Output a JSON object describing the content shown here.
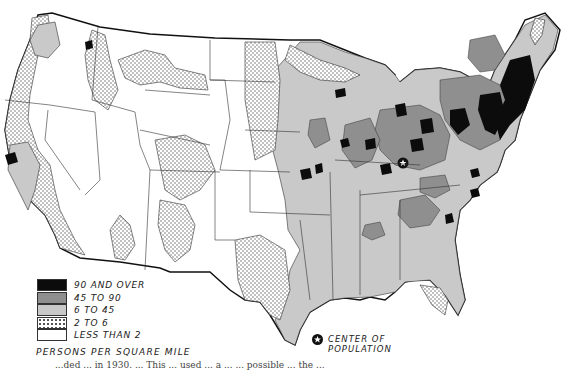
{
  "map": {
    "title": "Population density of the United States",
    "region": "Contiguous United States"
  },
  "legend": {
    "title": "PERSONS PER SQUARE MILE",
    "items": [
      {
        "label": "90 AND OVER",
        "color": "#0c0c0c",
        "pattern": "solid"
      },
      {
        "label": "45 TO 90",
        "color": "#8f8f8f",
        "pattern": "solid"
      },
      {
        "label": "6 TO 45",
        "color": "#c9c9c9",
        "pattern": "solid"
      },
      {
        "label": "2 TO 6",
        "color": "#ffffff",
        "pattern": "dotted"
      },
      {
        "label": "LESS THAN 2",
        "color": "#ffffff",
        "pattern": "solid"
      }
    ]
  },
  "center_of_population": {
    "label_line1": "CENTER OF",
    "label_line2": "POPULATION",
    "icon": "star-in-circle-icon"
  },
  "caption": {
    "text": "...ded ... in 1930. ... This ... used ... a ... ... possible ... the ... "
  }
}
